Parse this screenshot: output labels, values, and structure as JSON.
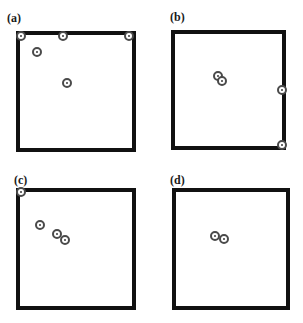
{
  "panels": [
    {
      "label": "(a)",
      "label_pos": [
        7,
        12
      ],
      "box": {
        "left": 16,
        "top": 31,
        "right": 136,
        "bottom": 152
      },
      "markers": [
        [
          21,
          36
        ],
        [
          63,
          36
        ],
        [
          129,
          36
        ],
        [
          37,
          52
        ],
        [
          67,
          83
        ]
      ]
    },
    {
      "label": "(b)",
      "label_pos": [
        170,
        11
      ],
      "box": {
        "left": 171,
        "top": 30,
        "right": 286,
        "bottom": 150
      },
      "markers": [
        [
          218,
          76
        ],
        [
          222,
          81
        ],
        [
          282,
          90
        ],
        [
          282,
          145
        ]
      ]
    },
    {
      "label": "(c)",
      "label_pos": [
        14,
        174
      ],
      "box": {
        "left": 16,
        "top": 188,
        "right": 136,
        "bottom": 310
      },
      "markers": [
        [
          21,
          192
        ],
        [
          40,
          225
        ],
        [
          57,
          234
        ],
        [
          65,
          240
        ]
      ]
    },
    {
      "label": "(d)",
      "label_pos": [
        170,
        174
      ],
      "box": {
        "left": 172,
        "top": 188,
        "right": 290,
        "bottom": 310
      },
      "markers": [
        [
          215,
          236
        ],
        [
          224,
          239
        ]
      ]
    }
  ],
  "colors": {
    "box_border": "#111111",
    "marker_ring": "#4a4a4a",
    "background": "#ffffff"
  }
}
